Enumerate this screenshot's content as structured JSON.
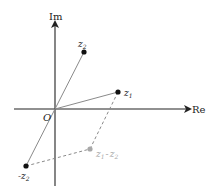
{
  "diagram": {
    "axes": {
      "x_label": "Re",
      "y_label": "Im",
      "origin_label": "O"
    },
    "points": [
      {
        "id": "z1",
        "label_main": "z",
        "label_sub": "1",
        "color": "#111111"
      },
      {
        "id": "z2",
        "label_main": "z",
        "label_sub": "2",
        "color": "#111111"
      },
      {
        "id": "neg_z2",
        "label_prefix": "-",
        "label_main": "z",
        "label_sub": "2",
        "color": "#111111"
      },
      {
        "id": "z1_minus_z2",
        "label_main_a": "z",
        "label_sub_a": "1",
        "label_op": "-",
        "label_main_b": "z",
        "label_sub_b": "2",
        "color": "#a8a8a8"
      }
    ],
    "colors": {
      "axis": "#222222",
      "vector": "#8a8a8a",
      "dashed": "#8a8a8a",
      "point_dark": "#111111",
      "point_gray": "#a8a8a8"
    }
  }
}
